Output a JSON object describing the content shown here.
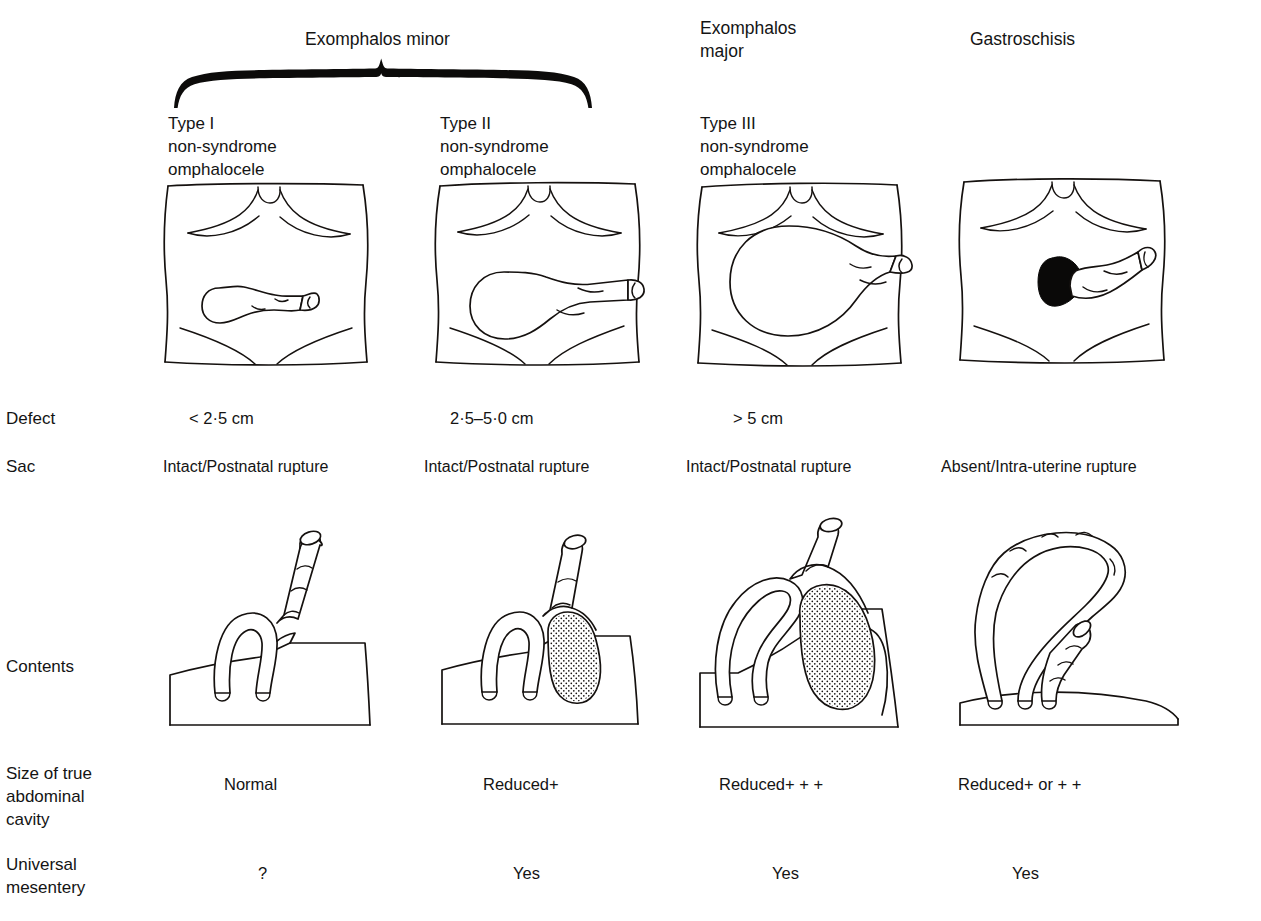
{
  "figure": {
    "group_headers": [
      {
        "id": "exomphalos-minor",
        "label": "Exomphalos minor"
      },
      {
        "id": "exomphalos-major",
        "label": "Exomphalos\nmajor"
      },
      {
        "id": "gastroschisis",
        "label": "Gastroschisis"
      }
    ],
    "columns": [
      {
        "id": "type-1",
        "header": "Type I\nnon-syndrome\nomphalocele"
      },
      {
        "id": "type-2",
        "header": "Type II\nnon-syndrome\nomphalocele"
      },
      {
        "id": "type-3",
        "header": "Type III\nnon-syndrome\nomphalocele"
      },
      {
        "id": "gastroschisis",
        "header": ""
      }
    ],
    "rows": [
      {
        "id": "defect",
        "label": "Defect",
        "values": [
          "< 2·5 cm",
          "2·5–5·0 cm",
          "> 5 cm",
          ""
        ]
      },
      {
        "id": "sac",
        "label": "Sac",
        "values": [
          "Intact/Postnatal rupture",
          "Intact/Postnatal rupture",
          "Intact/Postnatal rupture",
          "Absent/Intra-uterine rupture"
        ]
      },
      {
        "id": "contents",
        "label": "Contents",
        "values": [
          "",
          "",
          "",
          ""
        ]
      },
      {
        "id": "abdominal-cavity-size",
        "label": "Size of true\nabdominal\ncavity",
        "values": [
          "Normal",
          "Reduced+",
          "Reduced+ + +",
          "Reduced+ or + +"
        ]
      },
      {
        "id": "universal-mesentery",
        "label": "Universal\nmesentery",
        "values": [
          "?",
          "Yes",
          "Yes",
          "Yes"
        ]
      }
    ],
    "illustrations": {
      "abdominal_wall": {
        "caption_hint": "anterior abdominal wall of neonate, frontal view",
        "items": [
          {
            "id": "torso-type-1",
            "defect_style": "small-sac-with-cord"
          },
          {
            "id": "torso-type-2",
            "defect_style": "medium-sac-with-cord"
          },
          {
            "id": "torso-type-3",
            "defect_style": "large-sac-with-cord"
          },
          {
            "id": "torso-gastroschisis",
            "defect_style": "black-paraumbilical-defect-with-separate-cord"
          }
        ]
      },
      "contents": {
        "caption_hint": "sagittal view of herniated viscera",
        "items": [
          {
            "id": "contents-type-1",
            "bowel_loops": 1,
            "liver": false,
            "abdomen_profile": "domed"
          },
          {
            "id": "contents-type-2",
            "bowel_loops": 1,
            "liver": true,
            "abdomen_profile": "domed"
          },
          {
            "id": "contents-type-3",
            "bowel_loops": 2,
            "liver": true,
            "abdomen_profile": "flat"
          },
          {
            "id": "contents-gastroschisis",
            "bowel_loops": 3,
            "liver": false,
            "abdomen_profile": "very-flat"
          }
        ]
      }
    },
    "colors": {
      "ink": "#15110f",
      "background": "#ffffff",
      "defect_fill": "#0a0908"
    }
  }
}
